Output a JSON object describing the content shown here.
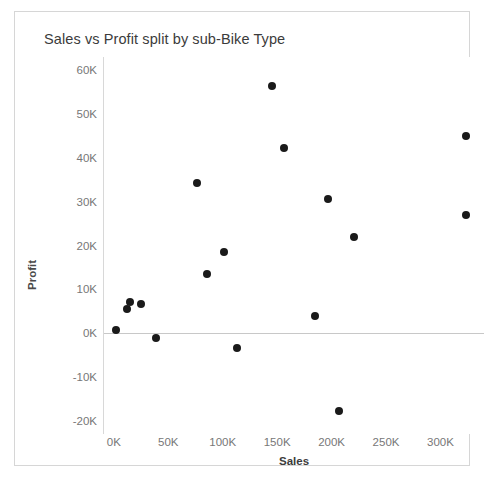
{
  "chart_data": {
    "type": "scatter",
    "title": "Sales vs Profit split by sub-Bike Type",
    "xlabel": "Sales",
    "ylabel": "Profit",
    "xlim": [
      -10000,
      340000
    ],
    "ylim": [
      -23000,
      63000
    ],
    "xticks": [
      0,
      50000,
      100000,
      150000,
      200000,
      250000,
      300000
    ],
    "xticklabels": [
      "0K",
      "50K",
      "100K",
      "150K",
      "200K",
      "250K",
      "300K"
    ],
    "yticks": [
      -20000,
      -10000,
      0,
      10000,
      20000,
      30000,
      40000,
      50000,
      60000
    ],
    "yticklabels": [
      "-20K",
      "-10K",
      "0K",
      "10K",
      "20K",
      "30K",
      "40K",
      "50K",
      "60K"
    ],
    "grid": false,
    "legend": null,
    "reference_line": {
      "axis": "y",
      "value": 0,
      "color": "#c8c8c8"
    },
    "marker_color": "#1a1a1a",
    "marker_size": 8,
    "points": [
      {
        "x": 1000,
        "y": 700
      },
      {
        "x": 11000,
        "y": 5600
      },
      {
        "x": 14000,
        "y": 7100
      },
      {
        "x": 24000,
        "y": 6600
      },
      {
        "x": 38000,
        "y": -1100
      },
      {
        "x": 75000,
        "y": 34200
      },
      {
        "x": 85000,
        "y": 13600
      },
      {
        "x": 100000,
        "y": 18600
      },
      {
        "x": 112000,
        "y": -3300
      },
      {
        "x": 144000,
        "y": 56400
      },
      {
        "x": 155000,
        "y": 42300
      },
      {
        "x": 184000,
        "y": 4000
      },
      {
        "x": 196000,
        "y": 30600
      },
      {
        "x": 206000,
        "y": -17800
      },
      {
        "x": 220000,
        "y": 21900
      },
      {
        "x": 323000,
        "y": 45000
      },
      {
        "x": 323000,
        "y": 27000
      }
    ]
  }
}
